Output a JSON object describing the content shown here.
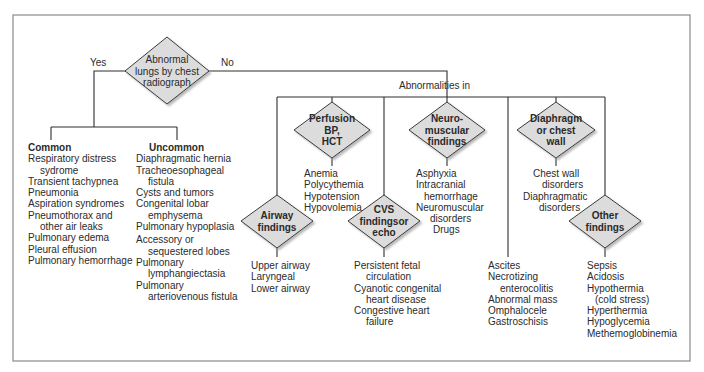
{
  "root": {
    "question": [
      "Abnormal",
      "lungs by chest",
      "radiograph"
    ],
    "yes_label": "Yes",
    "no_label": "No"
  },
  "yes_branch": {
    "common": {
      "heading": "Common",
      "items": [
        [
          "Respiratory distress",
          "sydrome"
        ],
        [
          "Transient tachypnea"
        ],
        [
          "Pneumonia"
        ],
        [
          "Aspiration syndromes"
        ],
        [
          "Pneumothorax and",
          "other air leaks"
        ],
        [
          "Pulmonary edema"
        ],
        [
          "Pleural effusion"
        ],
        [
          "Pulmonary hemorrhage"
        ]
      ]
    },
    "uncommon": {
      "heading": "Uncommon",
      "items": [
        [
          "Diaphragmatic hernia"
        ],
        [
          "Tracheoesophageal",
          "fistula"
        ],
        [
          "Cysts and tumors"
        ],
        [
          "Congenital lobar",
          "emphysema"
        ],
        [
          "Pulmonary hypoplasia"
        ],
        [
          "Accessory or",
          "sequestered lobes"
        ],
        [
          "Pulmonary",
          "lymphangiectasia"
        ],
        [
          "Pulmonary",
          "arteriovenous fistula"
        ]
      ]
    }
  },
  "no_branch": {
    "label": "Abnormalities in",
    "categories": [
      {
        "id": "airway",
        "diamond": [
          "Airway",
          "findings"
        ],
        "items": [
          [
            "Upper airway"
          ],
          [
            "Laryngeal"
          ],
          [
            "Lower airway"
          ]
        ]
      },
      {
        "id": "perfusion",
        "diamond": [
          "Perfusion",
          "BP,",
          "HCT"
        ],
        "items": [
          [
            "Anemia"
          ],
          [
            "Polycythemia"
          ],
          [
            "Hypotension"
          ],
          [
            "Hypovolemia"
          ]
        ]
      },
      {
        "id": "cvs",
        "diamond": [
          "CVS",
          "findingsor",
          "echo"
        ],
        "items": [
          [
            "Persistent fetal",
            "circulation"
          ],
          [
            "Cyanotic congenital",
            "heart disease"
          ],
          [
            "Congestive heart",
            "failure"
          ]
        ]
      },
      {
        "id": "neuromuscular",
        "diamond": [
          "Neuro-",
          "muscular",
          "findings"
        ],
        "items": [
          [
            "Asphyxia"
          ],
          [
            "Intracranial",
            "hemorrhage"
          ],
          [
            "Neuromuscular"
          ],
          [
            "disorders"
          ],
          [
            "Drugs"
          ]
        ]
      },
      {
        "id": "abdominal",
        "diamond": null,
        "items": [
          [
            "Ascites"
          ],
          [
            "Necrotizing",
            "enterocolitis"
          ],
          [
            "Abnormal mass"
          ],
          [
            "Omphalocele"
          ],
          [
            "Gastroschisis"
          ]
        ]
      },
      {
        "id": "diaphragm",
        "diamond": [
          "Diaphragm",
          "or chest",
          "wall"
        ],
        "items": [
          [
            "Chest wall",
            "disorders"
          ],
          [
            "Diaphragmatic",
            "disorders"
          ]
        ]
      },
      {
        "id": "other",
        "diamond": [
          "Other",
          "findings"
        ],
        "items": [
          [
            "Sepsis"
          ],
          [
            "Acidosis"
          ],
          [
            "Hypothermia",
            "(cold stress)"
          ],
          [
            "Hyperthermia"
          ],
          [
            "Hypoglycemia"
          ],
          [
            "Methemoglobinemia"
          ]
        ]
      }
    ]
  },
  "colors": {
    "diamond_fill": "#dcdcdc",
    "line": "#2e2e2e",
    "border": "#8a8a8a"
  }
}
